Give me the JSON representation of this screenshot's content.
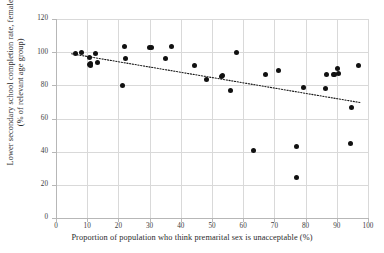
{
  "chart_data": {
    "type": "scatter",
    "title": "",
    "xlabel": "Proportion of population who think premarital sex is unacceptable (%)",
    "ylabel": "Lower secondary school completion rate, female\n(% of relevant age group)",
    "ylabel_line1": "Lower secondary school completion rate, female",
    "ylabel_line2": "(% of relevant age group)",
    "xlim": [
      0,
      100
    ],
    "ylim": [
      0,
      120
    ],
    "xticks": [
      0,
      10,
      20,
      30,
      40,
      50,
      60,
      70,
      80,
      90,
      100
    ],
    "yticks": [
      0,
      20,
      40,
      60,
      80,
      100,
      120
    ],
    "grid": true,
    "grid_color": "#d9d9d9",
    "marker_color": "#111111",
    "marker_size": 5,
    "legend": false,
    "points": [
      {
        "x": 6.2,
        "y": 99.2
      },
      {
        "x": 8.2,
        "y": 100.0
      },
      {
        "x": 10.6,
        "y": 96.8
      },
      {
        "x": 10.8,
        "y": 92.7
      },
      {
        "x": 11.0,
        "y": 93.4
      },
      {
        "x": 11.2,
        "y": 92.2
      },
      {
        "x": 12.8,
        "y": 99.4
      },
      {
        "x": 13.2,
        "y": 93.6
      },
      {
        "x": 21.3,
        "y": 79.9
      },
      {
        "x": 21.9,
        "y": 103.3
      },
      {
        "x": 22.2,
        "y": 96.4
      },
      {
        "x": 30.1,
        "y": 103.1
      },
      {
        "x": 30.5,
        "y": 102.6
      },
      {
        "x": 35.2,
        "y": 96.2
      },
      {
        "x": 36.9,
        "y": 103.3
      },
      {
        "x": 44.3,
        "y": 92.1
      },
      {
        "x": 48.1,
        "y": 83.7
      },
      {
        "x": 52.9,
        "y": 85.6
      },
      {
        "x": 53.3,
        "y": 85.9
      },
      {
        "x": 56.0,
        "y": 76.6
      },
      {
        "x": 58.0,
        "y": 100.0
      },
      {
        "x": 63.3,
        "y": 40.5
      },
      {
        "x": 67.0,
        "y": 86.3
      },
      {
        "x": 71.2,
        "y": 89.2
      },
      {
        "x": 77.0,
        "y": 24.6
      },
      {
        "x": 77.1,
        "y": 43.0
      },
      {
        "x": 79.2,
        "y": 78.7
      },
      {
        "x": 86.5,
        "y": 78.0
      },
      {
        "x": 86.8,
        "y": 86.8
      },
      {
        "x": 88.8,
        "y": 86.4
      },
      {
        "x": 89.3,
        "y": 86.5
      },
      {
        "x": 90.3,
        "y": 90.1
      },
      {
        "x": 90.7,
        "y": 87.2
      },
      {
        "x": 94.3,
        "y": 45.0
      },
      {
        "x": 94.6,
        "y": 66.4
      },
      {
        "x": 97.0,
        "y": 91.9
      }
    ],
    "trendline": {
      "style": "dotted",
      "color": "#1a1a1a",
      "x0": 5.0,
      "y0": 99.0,
      "x1": 97.5,
      "y1": 69.6
    }
  }
}
